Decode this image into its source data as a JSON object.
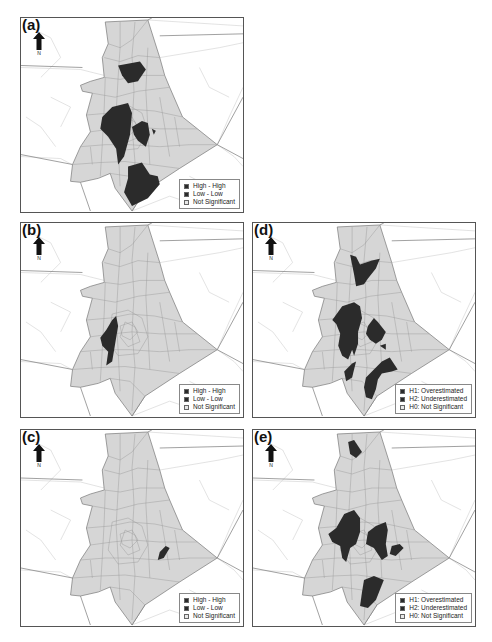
{
  "colors": {
    "county_fill": "#d6d6d6",
    "cluster_fill": "#2b2b2b",
    "tract_line": "#9a9a9a",
    "background_line": "#d0d0d0",
    "border": "#555555"
  },
  "north_arrow": {
    "label": "N"
  },
  "panels": [
    {
      "id": "a",
      "label": "(a)",
      "legend": [
        {
          "label": "High - High",
          "color": "#2b2b2b"
        },
        {
          "label": "Low - Low",
          "color": "#2b2b2b"
        },
        {
          "label": "Not Significant",
          "color": "#e8e8e8"
        }
      ]
    },
    {
      "id": "b",
      "label": "(b)",
      "legend": [
        {
          "label": "High - High",
          "color": "#2b2b2b"
        },
        {
          "label": "Low - Low",
          "color": "#2b2b2b"
        },
        {
          "label": "Not Significant",
          "color": "#e8e8e8"
        }
      ]
    },
    {
      "id": "c",
      "label": "(c)",
      "legend": [
        {
          "label": "High - High",
          "color": "#2b2b2b"
        },
        {
          "label": "Low - Low",
          "color": "#2b2b2b"
        },
        {
          "label": "Not Significant",
          "color": "#e8e8e8"
        }
      ]
    },
    {
      "id": "d",
      "label": "(d)",
      "legend": [
        {
          "label": "H1: Overestimated",
          "color": "#2b2b2b"
        },
        {
          "label": "H2: Underestimated",
          "color": "#2b2b2b"
        },
        {
          "label": "H0: Not Significant",
          "color": "#e8e8e8"
        }
      ]
    },
    {
      "id": "e",
      "label": "(e)",
      "legend": [
        {
          "label": "H1: Overestimated",
          "color": "#2b2b2b"
        },
        {
          "label": "H2: Underestimated",
          "color": "#2b2b2b"
        },
        {
          "label": "H0: Not Significant",
          "color": "#e8e8e8"
        }
      ]
    }
  ]
}
